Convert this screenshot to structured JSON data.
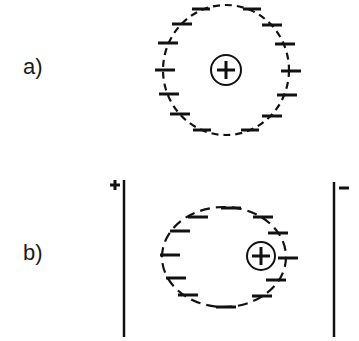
{
  "panels": [
    {
      "label": "a)",
      "description": "Free atom: positive nucleus centered in a spherical cloud of negative charges",
      "nucleus_symbol": "+",
      "charge_symbol": "−"
    },
    {
      "label": "b)",
      "description": "Atom in electric field between plates: nucleus shifted toward negative plate",
      "nucleus_symbol": "+",
      "charge_symbol": "−",
      "left_plate_sign": "+",
      "right_plate_sign": "−"
    }
  ],
  "colors": {
    "ink": "#111111",
    "background": "#ffffff"
  }
}
